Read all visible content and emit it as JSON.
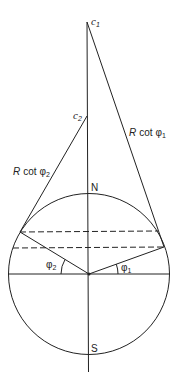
{
  "diagram": {
    "labels": {
      "c1": "c",
      "c1_sub": "1",
      "c2": "c",
      "c2_sub": "2",
      "r_cot_phi1_prefix": "R",
      "r_cot_phi1_cot": "cot",
      "r_cot_phi1_phi": "φ",
      "r_cot_phi1_sub": "1",
      "r_cot_phi2_prefix": "R",
      "r_cot_phi2_cot": "cot",
      "r_cot_phi2_phi": "φ",
      "r_cot_phi2_sub": "2",
      "north": "N",
      "south": "S",
      "phi1": "φ",
      "phi1_sub": "1",
      "phi2": "φ",
      "phi2_sub": "2"
    },
    "geometry": {
      "center": [
        89,
        274
      ],
      "radius": 80.5,
      "apex_c1": [
        87,
        22
      ],
      "apex_c2": [
        87,
        116
      ],
      "tangent_point_phi1": [
        164,
        247
      ],
      "tangent_point_phi2": [
        20,
        232
      ]
    },
    "colors": {
      "stroke": "#222222",
      "background": "#ffffff"
    }
  }
}
